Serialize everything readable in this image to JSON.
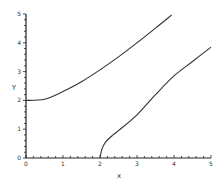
{
  "chart_data": {
    "type": "line",
    "title": "",
    "xlabel": "x",
    "ylabel": "Y",
    "xlim": [
      0,
      5
    ],
    "ylim": [
      0,
      5
    ],
    "grid": false,
    "legend": null,
    "x_ticks": [
      "0",
      "1",
      "2",
      "3",
      "4",
      "5"
    ],
    "y_ticks": [
      "0",
      "1",
      "2",
      "3",
      "4",
      "5"
    ],
    "series": [
      {
        "name": "upper branch",
        "x": [
          0,
          0.5,
          1,
          1.5,
          2,
          2.5,
          3,
          3.5,
          3.94
        ],
        "y": [
          2.0,
          2.04,
          2.31,
          2.65,
          3.06,
          3.51,
          4.0,
          4.51,
          4.97
        ]
      },
      {
        "name": "lower branch",
        "x": [
          2.0,
          2.05,
          2.15,
          2.35,
          2.5,
          3.0,
          3.5,
          4.0,
          4.5,
          5.0
        ],
        "y": [
          0.0,
          0.3,
          0.55,
          0.8,
          0.95,
          1.5,
          2.2,
          2.85,
          3.35,
          3.85
        ]
      }
    ]
  }
}
